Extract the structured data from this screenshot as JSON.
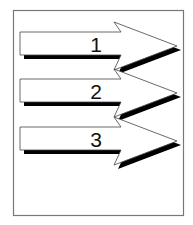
{
  "diagram": {
    "type": "sequential-arrows",
    "frame": {
      "stroke": "#777777"
    },
    "arrows": [
      {
        "label": "1"
      },
      {
        "label": "2"
      },
      {
        "label": "3"
      }
    ],
    "colors": {
      "arrow_fill": "#ffffff",
      "arrow_stroke": "#444444",
      "shadow": "#000000"
    }
  }
}
